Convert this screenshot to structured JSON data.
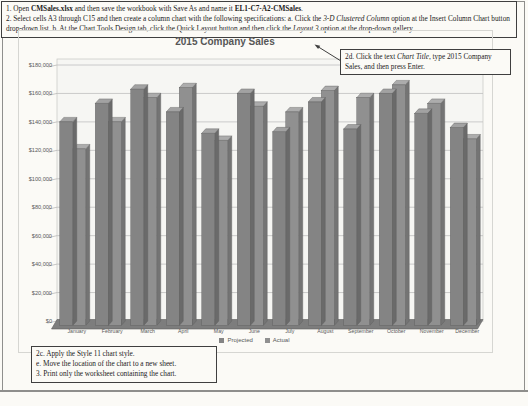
{
  "colors": {
    "paper": "#fbfaf6",
    "bar_projected": "#848484",
    "bar_actual": "#909090",
    "bar_top_projected": "#a2a2a2",
    "bar_top_actual": "#acacac",
    "bar_side_projected": "#6a6a6a",
    "bar_side_actual": "#747474",
    "bar_edge": "#5c5c5c",
    "wall": "#f6f6f3",
    "grid": "#bfbfbf",
    "wall_border": "#c6c6c3",
    "floor": "#7d7d7d",
    "axis_text": "#595959",
    "title_text": "#565656",
    "arrow": "#3f3f3f"
  },
  "instructions_top": {
    "paragraphs": [
      {
        "runs": [
          {
            "t": "1. Open "
          },
          {
            "t": "CMSales.xlsx",
            "b": true
          },
          {
            "t": " and then save the workbook with Save As and name it "
          },
          {
            "t": "EL1-C7-A2-CMSales",
            "b": true
          },
          {
            "t": "."
          }
        ]
      },
      {
        "runs": [
          {
            "t": "2. Select cells A3 through C15 and then create a column chart with the following specifications: a. Click the "
          },
          {
            "t": "3-D Clustered Column",
            "i": true
          },
          {
            "t": " option at the Insert Column Chart button drop-down list. b. At the Chart Tools Design tab, click the Quick Layout button and then click the "
          },
          {
            "t": "Layout 3",
            "i": true
          },
          {
            "t": " option at the drop-down gallery."
          }
        ]
      }
    ]
  },
  "callout": {
    "runs": [
      {
        "t": "2d. Click the text "
      },
      {
        "t": "Chart Title",
        "i": true
      },
      {
        "t": ", type 2015 Company Sales, and then press Enter."
      }
    ]
  },
  "instructions_bottom": {
    "lines": [
      "2c. Apply the Style 11 chart style.",
      "e. Move the location of the chart to a new sheet.",
      "3. Print only the worksheet containing the chart."
    ]
  },
  "chart_data": {
    "type": "bar",
    "variant": "3d-clustered-column",
    "title": "2015 Company Sales",
    "categories": [
      "January",
      "February",
      "March",
      "April",
      "May",
      "June",
      "July",
      "August",
      "September",
      "October",
      "November",
      "December"
    ],
    "series": [
      {
        "name": "Projected",
        "values": [
          140000,
          153000,
          163000,
          147000,
          132000,
          160000,
          133000,
          154000,
          135000,
          160000,
          146000,
          136000
        ]
      },
      {
        "name": "Actual",
        "values": [
          121000,
          140000,
          157000,
          164000,
          127000,
          151000,
          147000,
          162000,
          157000,
          166000,
          153000,
          128000
        ]
      }
    ],
    "xlabel": "",
    "ylabel": "",
    "ylim": [
      0,
      180000
    ],
    "ytick_step": 20000,
    "ytick_labels": [
      "$0",
      "$20,000",
      "$40,000",
      "$60,000",
      "$80,000",
      "$100,000",
      "$120,000",
      "$140,000",
      "$160,000",
      "$180,000"
    ],
    "grid": true,
    "legend_position": "bottom"
  }
}
